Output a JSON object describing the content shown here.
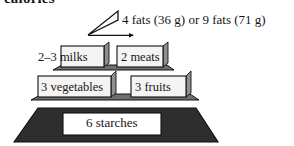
{
  "figure": {
    "title_clipped": "calories",
    "type": "food-exchange-pyramid"
  },
  "tiers": [
    {
      "id": "fats",
      "level": 1,
      "label": "4 fats (36 g) or 9 fats (71 g)",
      "servings_text": "4 fats (36 g) or 9 fats (71 g)"
    },
    {
      "id": "milks",
      "level": 2,
      "label": "2–3 milks",
      "servings_text": "2–3 milks"
    },
    {
      "id": "meats",
      "level": 2,
      "label": "2 meats",
      "servings_text": "2 meats"
    },
    {
      "id": "vegetables",
      "level": 3,
      "label": "3 vegetables",
      "servings_text": "3 vegetables"
    },
    {
      "id": "fruits",
      "level": 3,
      "label": "3 fruits",
      "servings_text": "3 fruits"
    },
    {
      "id": "starches",
      "level": 4,
      "label": "6 starches",
      "servings_text": "6 starches"
    }
  ],
  "colors": {
    "background": "#ffffff",
    "text": "#161616",
    "outline": "#111111",
    "box_fill": "#f2f2f2",
    "box_fill_light": "#fafafa",
    "shadow_fill": "#9a9a9a",
    "band_fill": "#8c8c8c",
    "base_fill": "#2e2e2e",
    "base_box_fill": "#ffffff"
  }
}
